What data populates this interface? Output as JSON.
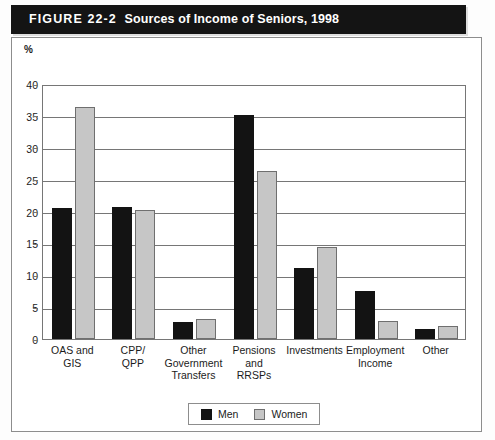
{
  "figure": {
    "label": "FIGURE 22-2",
    "title": "Sources of Income of Seniors, 1998"
  },
  "axis": {
    "unit_label": "%",
    "y_ticks": [
      "40",
      "35",
      "30",
      "25",
      "20",
      "15",
      "10",
      "5",
      "0"
    ]
  },
  "legend": {
    "items": [
      {
        "label": "Men",
        "color": "#131313"
      },
      {
        "label": "Women",
        "color": "#c6c6c6"
      }
    ]
  },
  "chart_data": {
    "type": "bar",
    "title": "Sources of Income of Seniors, 1998",
    "xlabel": "",
    "ylabel": "%",
    "ylim": [
      0,
      40
    ],
    "ytick_step": 5,
    "grid": true,
    "legend_position": "bottom",
    "categories": [
      "OAS and GIS",
      "CPP/ QPP",
      "Other Government Transfers",
      "Pensions and RRSPs",
      "Investments",
      "Employment Income",
      "Other"
    ],
    "category_lines": [
      [
        "OAS and",
        "GIS"
      ],
      [
        "CPP/",
        "QPP"
      ],
      [
        "Other",
        "Government",
        "Transfers"
      ],
      [
        "Pensions",
        "and",
        "RRSPs"
      ],
      [
        "Investments"
      ],
      [
        "Employment",
        "Income"
      ],
      [
        "Other"
      ]
    ],
    "series": [
      {
        "name": "Men",
        "color": "#131313",
        "values": [
          20.5,
          20.7,
          2.6,
          35.2,
          11.1,
          7.6,
          1.5
        ]
      },
      {
        "name": "Women",
        "color": "#c6c6c6",
        "values": [
          36.4,
          20.2,
          3.1,
          26.4,
          14.5,
          2.9,
          2.1
        ]
      }
    ]
  }
}
